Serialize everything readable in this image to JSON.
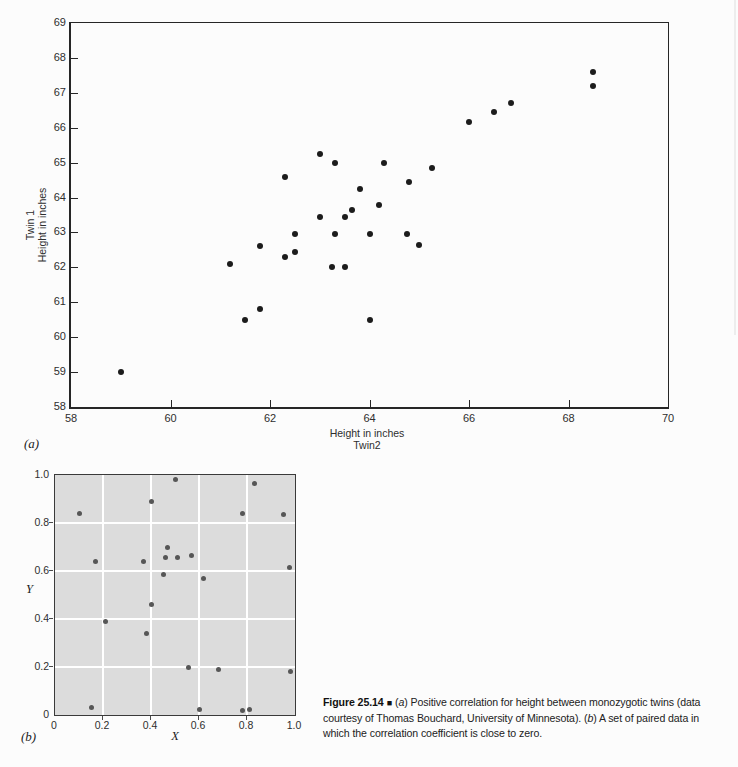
{
  "figure": {
    "panel_a_label": "(a)",
    "panel_b_label": "(b)"
  },
  "caption": {
    "figure_label": "Figure 25.14",
    "separator": "■",
    "line1_open_paren": "(",
    "line1_italic": "a",
    "line1_rest": ") Positive correlation for height between monozygotic twins (data",
    "line2_pre": "courtesy of Thomas Bouchard, University of Minnesota). (",
    "line2_italic": "b",
    "line2_rest": ") A set of paired data in",
    "line3": "which the correlation coefficient is close to zero."
  },
  "chart_data": [
    {
      "id": "twin-height-scatter",
      "type": "scatter",
      "xlabel": "Height in inches",
      "xlabel_line2": "Twin2",
      "ylabel_line1": "Twin 1",
      "ylabel_line2": "Height in inches",
      "xlim": [
        58,
        70
      ],
      "ylim": [
        58,
        69
      ],
      "x_ticks": [
        "58",
        "60",
        "62",
        "64",
        "66",
        "68",
        "70"
      ],
      "y_ticks": [
        "58",
        "59",
        "60",
        "61",
        "62",
        "63",
        "64",
        "65",
        "66",
        "67",
        "68",
        "69"
      ],
      "grid": false,
      "point_color": "#1c1c1c",
      "points": [
        [
          59.0,
          59.0
        ],
        [
          61.2,
          62.1
        ],
        [
          61.5,
          60.5
        ],
        [
          61.8,
          62.6
        ],
        [
          61.8,
          60.8
        ],
        [
          62.3,
          62.3
        ],
        [
          62.3,
          64.6
        ],
        [
          62.5,
          62.45
        ],
        [
          62.5,
          62.95
        ],
        [
          63.0,
          63.45
        ],
        [
          63.0,
          65.25
        ],
        [
          63.25,
          62.0
        ],
        [
          63.3,
          62.95
        ],
        [
          63.3,
          65.0
        ],
        [
          63.5,
          63.45
        ],
        [
          63.5,
          62.0
        ],
        [
          63.65,
          63.65
        ],
        [
          63.8,
          64.25
        ],
        [
          64.0,
          62.95
        ],
        [
          64.0,
          60.5
        ],
        [
          64.2,
          63.8
        ],
        [
          64.3,
          65.0
        ],
        [
          64.75,
          62.95
        ],
        [
          64.8,
          64.45
        ],
        [
          65.0,
          62.65
        ],
        [
          65.25,
          64.85
        ],
        [
          66.0,
          66.15
        ],
        [
          66.5,
          66.45
        ],
        [
          66.85,
          66.7
        ],
        [
          68.5,
          67.6
        ],
        [
          68.5,
          67.2
        ]
      ]
    },
    {
      "id": "zero-correlation-scatter",
      "type": "scatter",
      "xlabel": "X",
      "ylabel": "Y",
      "xlim": [
        0,
        1
      ],
      "ylim": [
        0,
        1
      ],
      "x_ticks": [
        "0",
        "0.2",
        "0.4",
        "0.6",
        "0.8",
        "1.0"
      ],
      "y_ticks": [
        "0",
        "0.2",
        "0.4",
        "0.6",
        "0.8",
        "1.0"
      ],
      "grid": true,
      "grid_color": "#ffffff",
      "bg_color": "#dcdcdc",
      "point_color": "#565656",
      "points": [
        [
          0.1,
          0.84
        ],
        [
          0.15,
          0.03
        ],
        [
          0.17,
          0.64
        ],
        [
          0.21,
          0.39
        ],
        [
          0.37,
          0.64
        ],
        [
          0.38,
          0.34
        ],
        [
          0.4,
          0.89
        ],
        [
          0.4,
          0.46
        ],
        [
          0.45,
          0.585
        ],
        [
          0.46,
          0.655
        ],
        [
          0.47,
          0.7
        ],
        [
          0.5,
          0.98
        ],
        [
          0.51,
          0.655
        ],
        [
          0.555,
          0.2
        ],
        [
          0.57,
          0.665
        ],
        [
          0.6,
          0.025
        ],
        [
          0.62,
          0.57
        ],
        [
          0.68,
          0.19
        ],
        [
          0.78,
          0.02
        ],
        [
          0.78,
          0.84
        ],
        [
          0.81,
          0.025
        ],
        [
          0.83,
          0.965
        ],
        [
          0.95,
          0.835
        ],
        [
          0.975,
          0.615
        ],
        [
          0.98,
          0.18
        ]
      ]
    }
  ]
}
